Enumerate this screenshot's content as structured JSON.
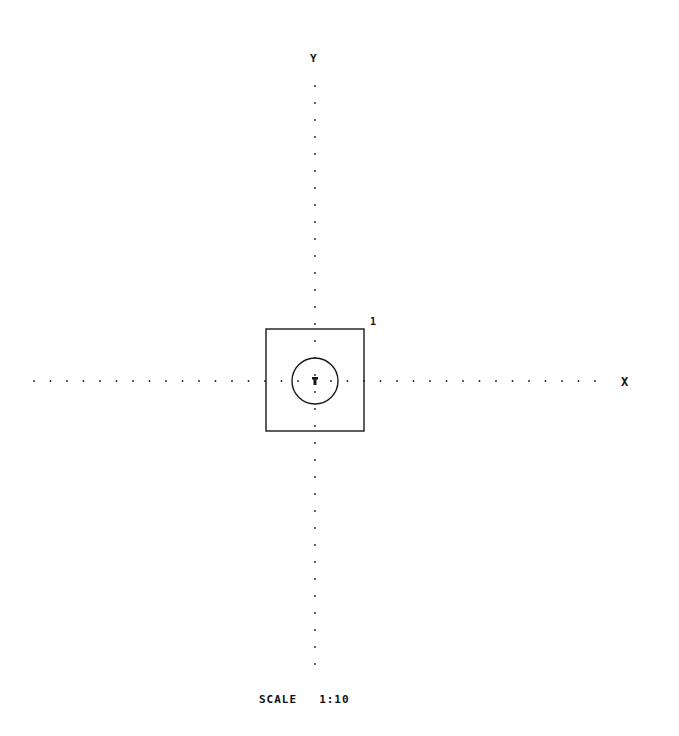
{
  "drawing": {
    "axes": {
      "x_label": "X",
      "y_label": "Y"
    },
    "part_number": "1",
    "scale_label": "SCALE",
    "scale_value": "1:10",
    "origin": {
      "x": 315,
      "y": 381
    },
    "square": {
      "left": 266,
      "top": 329,
      "right": 364,
      "bottom": 431
    },
    "circle": {
      "cx": 315,
      "cy": 381,
      "r": 23
    },
    "x_axis_dots": {
      "start": 34,
      "end": 605,
      "step": 16.5,
      "y": 381
    },
    "y_axis_dots": {
      "start": 86,
      "end": 670,
      "step": 17,
      "x": 315
    },
    "line_color": "#1a1a1a"
  }
}
